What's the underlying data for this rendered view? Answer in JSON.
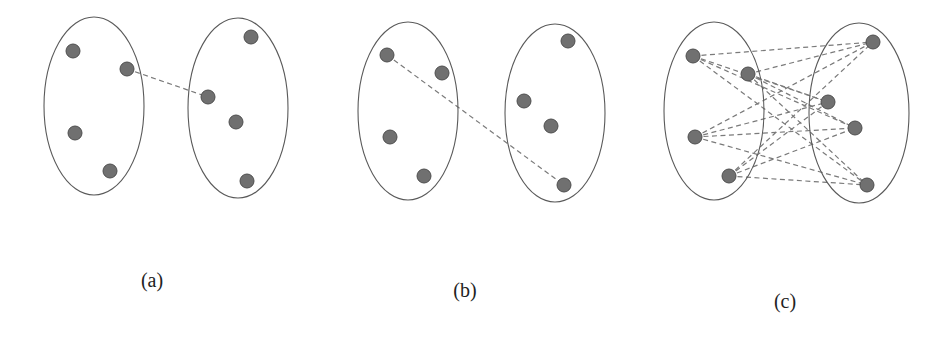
{
  "figure": {
    "panels": [
      {
        "id": "a",
        "caption": "(a)",
        "caption_pos": [
          152,
          287
        ],
        "clusters": [
          {
            "cx": 94,
            "cy": 106,
            "rx": 50,
            "ry": 89
          },
          {
            "cx": 238,
            "cy": 108,
            "rx": 50,
            "ry": 90
          }
        ],
        "nodes": [
          [
            73,
            51
          ],
          [
            127,
            69
          ],
          [
            75,
            133
          ],
          [
            110,
            171
          ],
          [
            251,
            37
          ],
          [
            208,
            97
          ],
          [
            236,
            122
          ],
          [
            247,
            181
          ]
        ],
        "edges": [
          [
            1,
            5
          ]
        ]
      },
      {
        "id": "b",
        "caption": "(b)",
        "caption_pos": [
          465,
          297
        ],
        "clusters": [
          {
            "cx": 408,
            "cy": 111,
            "rx": 50,
            "ry": 89
          },
          {
            "cx": 555,
            "cy": 113,
            "rx": 50,
            "ry": 89
          }
        ],
        "nodes": [
          [
            387,
            55
          ],
          [
            442,
            73
          ],
          [
            390,
            137
          ],
          [
            424,
            176
          ],
          [
            568,
            41
          ],
          [
            524,
            101
          ],
          [
            551,
            126
          ],
          [
            564,
            185
          ]
        ],
        "edges": [
          [
            0,
            7
          ]
        ]
      },
      {
        "id": "c",
        "caption": "(c)",
        "caption_pos": [
          785,
          308
        ],
        "clusters": [
          {
            "cx": 714,
            "cy": 111,
            "rx": 50,
            "ry": 89
          },
          {
            "cx": 859,
            "cy": 113,
            "rx": 50,
            "ry": 90
          }
        ],
        "nodes": [
          [
            693,
            56
          ],
          [
            748,
            74
          ],
          [
            695,
            137
          ],
          [
            729,
            176
          ],
          [
            873,
            42
          ],
          [
            828,
            102
          ],
          [
            855,
            128
          ],
          [
            867,
            185
          ]
        ],
        "edges": [
          [
            0,
            4
          ],
          [
            0,
            5
          ],
          [
            0,
            6
          ],
          [
            0,
            7
          ],
          [
            1,
            4
          ],
          [
            1,
            5
          ],
          [
            1,
            6
          ],
          [
            1,
            7
          ],
          [
            2,
            4
          ],
          [
            2,
            5
          ],
          [
            2,
            6
          ],
          [
            2,
            7
          ],
          [
            3,
            4
          ],
          [
            3,
            5
          ],
          [
            3,
            6
          ],
          [
            3,
            7
          ]
        ]
      }
    ],
    "style": {
      "node_radius": 7,
      "node_fill": "#707070",
      "edge_color": "#7a7a7a",
      "cluster_stroke": "#5a5a5a"
    }
  }
}
